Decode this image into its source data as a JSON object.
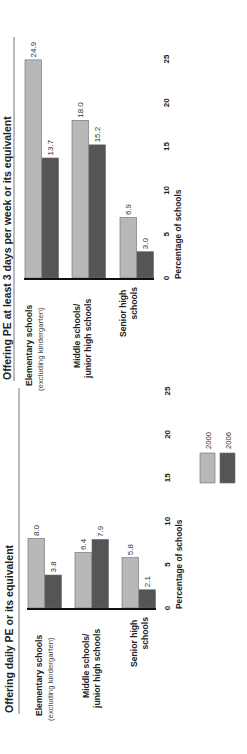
{
  "chart_data": [
    {
      "type": "bar",
      "orientation": "rotated-90-ccw",
      "title": "Offering PE at least 3 days per week or its equivalent",
      "xlabel": "",
      "ylabel": "Percentage of schools",
      "ylim": [
        0,
        25
      ],
      "yticks": [
        0,
        5,
        10,
        15,
        20,
        25
      ],
      "grid": false,
      "categories": [
        {
          "line1": "Elementary schools",
          "line2": "(excluding kindergarten)"
        },
        {
          "line1": "Middle schools/",
          "line2": "junior high schools"
        },
        {
          "line1": "Senior high",
          "line2": "schools"
        }
      ],
      "series": [
        {
          "name": "2000",
          "values": [
            24.9,
            18.0,
            6.9
          ],
          "labels": [
            "24.9",
            "18.0",
            "6.9"
          ]
        },
        {
          "name": "2006",
          "values": [
            13.7,
            15.2,
            3.0
          ],
          "labels": [
            "13.7",
            "15.2",
            "3.0"
          ]
        }
      ]
    },
    {
      "type": "bar",
      "orientation": "rotated-90-ccw",
      "title": "Offering daily PE or its equivalent",
      "xlabel": "",
      "ylabel": "Percentage of schools",
      "ylim": [
        0,
        25
      ],
      "yticks": [
        0,
        5,
        10,
        15,
        20,
        25
      ],
      "grid": false,
      "legend": {
        "placement": "right",
        "entries": [
          "2000",
          "2006"
        ]
      },
      "categories": [
        {
          "line1": "Elementary schools",
          "line2": "(excluding kindergarten)"
        },
        {
          "line1": "Middle schools/",
          "line2": "junior high schools"
        },
        {
          "line1": "Senior high",
          "line2": "schools"
        }
      ],
      "series": [
        {
          "name": "2000",
          "values": [
            8.0,
            6.4,
            5.8
          ],
          "labels": [
            "8.0",
            "6.4",
            "5.8"
          ]
        },
        {
          "name": "2006",
          "values": [
            3.8,
            7.9,
            2.1
          ],
          "labels": [
            "3.8",
            "7.9",
            "2.1"
          ]
        }
      ]
    }
  ],
  "colors": {
    "series_2000": "#b8b8b8",
    "series_2006": "#555555",
    "baseline": "#111111",
    "divider": "#777777"
  }
}
